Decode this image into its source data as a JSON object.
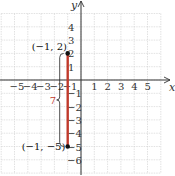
{
  "chart_data": {
    "type": "line",
    "title": "",
    "xlabel": "x",
    "ylabel": "y",
    "xlim": [
      -6,
      6
    ],
    "ylim": [
      -7,
      5
    ],
    "grid": true,
    "x_tick_labels": [
      "−5",
      "−4",
      "−3",
      "−2",
      "−1",
      "1",
      "2",
      "3",
      "4",
      "5"
    ],
    "x_ticks": [
      -5,
      -4,
      -3,
      -2,
      -1,
      1,
      2,
      3,
      4,
      5
    ],
    "y_tick_labels": [
      "4",
      "3",
      "2",
      "1",
      "1",
      "2",
      "3",
      "4",
      "5",
      "6"
    ],
    "y_ticks": [
      4,
      3,
      2,
      1,
      -1,
      -2,
      -3,
      -4,
      -5,
      -6
    ],
    "series": [
      {
        "name": "segment",
        "color": "#c0392b",
        "x": [
          -1,
          -1
        ],
        "y": [
          2,
          -5
        ]
      }
    ],
    "points": [
      {
        "x": -1,
        "y": 2,
        "label": "(−1, 2)"
      },
      {
        "x": -1,
        "y": -5,
        "label": "(−1, −5)"
      }
    ],
    "annotations": [
      {
        "text": "7",
        "color": "#c0392b",
        "type": "brace",
        "from": [
          -1,
          2
        ],
        "to": [
          -1,
          -5
        ]
      }
    ]
  },
  "colors": {
    "segment": "#c0392b",
    "grid": "#cfcfcf",
    "axis": "#333333",
    "brace_label": "#c0392b"
  }
}
